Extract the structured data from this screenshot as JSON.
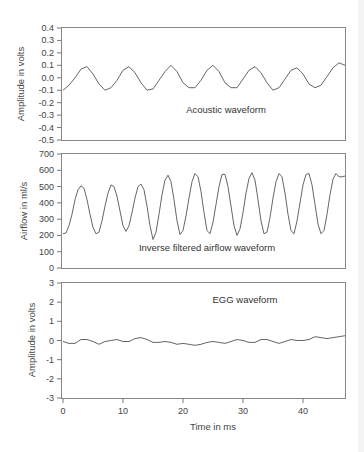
{
  "chart_data": [
    {
      "type": "line",
      "title": "Acoustic waveform",
      "xlabel": "",
      "ylabel": "Amplitude in volts",
      "xlim": [
        0,
        47
      ],
      "ylim": [
        -0.5,
        0.4
      ],
      "yticks": [
        "0.4",
        "0.3",
        "0.2",
        "0.1",
        "0.0",
        "-0.1",
        "-0.2",
        "-0.3",
        "-0.4",
        "-0.5"
      ],
      "grid": false,
      "series": [
        {
          "name": "Acoustic waveform",
          "x": [
            0,
            1,
            2,
            3,
            4,
            5,
            6,
            7,
            8,
            9,
            10,
            11,
            12,
            13,
            14,
            15,
            16,
            17,
            18,
            19,
            20,
            21,
            22,
            23,
            24,
            25,
            26,
            27,
            28,
            29,
            30,
            31,
            32,
            33,
            34,
            35,
            36,
            37,
            38,
            39,
            40,
            41,
            42,
            43,
            44,
            45,
            46,
            47
          ],
          "values": [
            -0.1,
            -0.06,
            0.0,
            0.07,
            0.09,
            0.03,
            -0.05,
            -0.1,
            -0.08,
            -0.02,
            0.06,
            0.09,
            0.04,
            -0.04,
            -0.1,
            -0.09,
            -0.02,
            0.05,
            0.1,
            0.05,
            -0.04,
            -0.08,
            -0.08,
            -0.02,
            0.06,
            0.1,
            0.05,
            -0.04,
            -0.08,
            -0.08,
            -0.01,
            0.06,
            0.09,
            0.04,
            -0.04,
            -0.1,
            -0.08,
            -0.01,
            0.06,
            0.08,
            0.03,
            -0.05,
            -0.08,
            -0.06,
            0.01,
            0.08,
            0.12,
            0.1
          ]
        }
      ]
    },
    {
      "type": "line",
      "title": "Inverse filtered airflow waveform",
      "xlabel": "",
      "ylabel": "Airflow in ml/s",
      "xlim": [
        0,
        47
      ],
      "ylim": [
        0,
        700
      ],
      "yticks": [
        "700",
        "600",
        "500",
        "400",
        "300",
        "200",
        "100",
        "0"
      ],
      "grid": false,
      "series": [
        {
          "name": "Inverse filtered airflow",
          "x": [
            0,
            0.5,
            1,
            1.5,
            2,
            2.5,
            3,
            3.5,
            4,
            4.5,
            5,
            5.5,
            6,
            6.5,
            7,
            7.5,
            8,
            8.5,
            9,
            9.5,
            10,
            10.5,
            11,
            11.5,
            12,
            12.5,
            13,
            13.5,
            14,
            14.5,
            15,
            15.5,
            16,
            16.5,
            17,
            17.5,
            18,
            18.5,
            19,
            19.5,
            20,
            20.5,
            21,
            21.5,
            22,
            22.5,
            23,
            23.5,
            24,
            24.5,
            25,
            25.5,
            26,
            26.5,
            27,
            27.5,
            28,
            28.5,
            29,
            29.5,
            30,
            30.5,
            31,
            31.5,
            32,
            32.5,
            33,
            33.5,
            34,
            34.5,
            35,
            35.5,
            36,
            36.5,
            37,
            37.5,
            38,
            38.5,
            39,
            39.5,
            40,
            40.5,
            41,
            41.5,
            42,
            42.5,
            43,
            43.5,
            44,
            44.5,
            45,
            45.5,
            46,
            46.5,
            47
          ],
          "values": [
            210,
            215,
            260,
            330,
            420,
            480,
            505,
            490,
            420,
            330,
            250,
            210,
            220,
            290,
            380,
            460,
            510,
            500,
            440,
            350,
            260,
            225,
            260,
            340,
            430,
            500,
            515,
            480,
            380,
            260,
            175,
            220,
            330,
            450,
            540,
            570,
            530,
            420,
            290,
            205,
            230,
            320,
            430,
            530,
            580,
            560,
            470,
            340,
            230,
            210,
            280,
            390,
            500,
            575,
            575,
            500,
            380,
            260,
            200,
            240,
            340,
            460,
            550,
            585,
            540,
            420,
            290,
            210,
            220,
            310,
            430,
            530,
            580,
            560,
            460,
            330,
            230,
            210,
            290,
            400,
            510,
            575,
            580,
            510,
            390,
            270,
            210,
            230,
            330,
            450,
            545,
            580,
            560,
            560,
            565
          ]
        }
      ]
    },
    {
      "type": "line",
      "title": "EGG waveform",
      "xlabel": "Time in ms",
      "ylabel": "Amplitude in volts",
      "xlim": [
        0,
        47
      ],
      "ylim": [
        -3,
        3
      ],
      "xticks": [
        "0",
        "10",
        "20",
        "30",
        "40"
      ],
      "yticks": [
        "3",
        "2",
        "1",
        "0",
        "-1",
        "-2",
        "-3"
      ],
      "grid": false,
      "series": [
        {
          "name": "EGG waveform",
          "x": [
            0,
            1,
            2,
            3,
            4,
            5,
            6,
            7,
            8,
            9,
            10,
            11,
            12,
            13,
            14,
            15,
            16,
            17,
            18,
            19,
            20,
            21,
            22,
            23,
            24,
            25,
            26,
            27,
            28,
            29,
            30,
            31,
            32,
            33,
            34,
            35,
            36,
            37,
            38,
            39,
            40,
            41,
            42,
            43,
            44,
            45,
            46,
            47
          ],
          "values": [
            -0.05,
            -0.15,
            -0.15,
            0.05,
            0.05,
            -0.05,
            -0.2,
            -0.05,
            0.0,
            0.05,
            -0.05,
            -0.05,
            0.1,
            0.15,
            0.05,
            -0.1,
            -0.1,
            -0.05,
            -0.1,
            -0.2,
            -0.15,
            -0.2,
            -0.25,
            -0.2,
            -0.1,
            -0.05,
            -0.1,
            -0.15,
            -0.05,
            0.05,
            0.0,
            -0.1,
            -0.1,
            0.05,
            0.05,
            -0.05,
            -0.15,
            -0.05,
            0.05,
            0.0,
            0.0,
            0.05,
            0.2,
            0.15,
            0.1,
            0.15,
            0.2,
            0.25
          ]
        }
      ]
    }
  ],
  "panels": {
    "acoustic": {
      "label": "Acoustic waveform",
      "ylabel": "Amplitude in volts",
      "yticks": [
        "0.4",
        "0.3",
        "0.2",
        "0.1",
        "0.0",
        "-0.1",
        "-0.2",
        "-0.3",
        "-0.4",
        "-0.5"
      ]
    },
    "airflow": {
      "label": "Inverse filtered airflow waveform",
      "ylabel": "Airflow in ml/s",
      "yticks": [
        "700",
        "600",
        "500",
        "400",
        "300",
        "200",
        "100",
        "0"
      ]
    },
    "egg": {
      "label": "EGG waveform",
      "ylabel": "Amplitude in volts",
      "yticks": [
        "3",
        "2",
        "1",
        "0",
        "-1",
        "-2",
        "-3"
      ]
    }
  },
  "xaxis": {
    "label": "Time in ms",
    "ticks": [
      "0",
      "10",
      "20",
      "30",
      "40"
    ]
  },
  "colors": {
    "line": "#555555",
    "frame": "#888888",
    "text": "#444444"
  }
}
